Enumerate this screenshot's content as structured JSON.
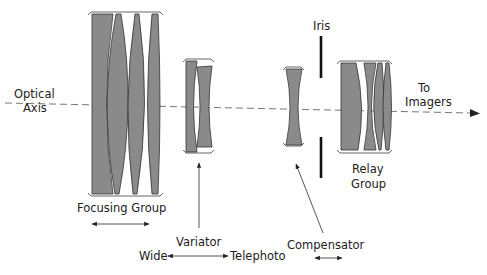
{
  "diagram": {
    "type": "optical-zoom-lens-schematic",
    "axis": {
      "label_line1": "Optical",
      "label_line2": "Axis",
      "end_label_line1": "To",
      "end_label_line2": "Imagers"
    },
    "groups": {
      "focusing": {
        "label": "Focusing Group",
        "motion": "bidirectional"
      },
      "variator": {
        "label": "Variator",
        "left_label": "Wide",
        "right_label": "Telephoto"
      },
      "compensator": {
        "label": "Compensator",
        "motion": "bidirectional"
      },
      "iris": {
        "label": "Iris"
      },
      "relay": {
        "label_line1": "Relay",
        "label_line2": "Group"
      }
    },
    "colors": {
      "lens_fill": "#8a8a8a",
      "outline": "#333333",
      "axis": "#777777",
      "background": "#ffffff"
    }
  }
}
